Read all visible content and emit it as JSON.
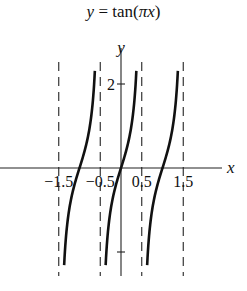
{
  "chart_data": {
    "type": "line",
    "title": "y = tan(πx)",
    "title_parts": {
      "lhs": "y",
      "eq": " = tan(",
      "pi": "π",
      "var": "x",
      "close": ")"
    },
    "xlabel": "x",
    "ylabel": "y",
    "function": "tan(pi*x)",
    "xlim": [
      -2.3,
      2.8
    ],
    "ylim": [
      -2.7,
      2.5
    ],
    "x_ticks": [
      -1.5,
      -0.5,
      0.5,
      1.5
    ],
    "x_tick_labels": [
      "-1.5",
      "-0.5",
      "0.5",
      "1.5"
    ],
    "y_ticks": [
      2,
      -2
    ],
    "y_tick_labels": [
      "2",
      ""
    ],
    "asymptotes": [
      -1.5,
      -0.5,
      0.5,
      1.5
    ],
    "branches": [
      {
        "center": -1,
        "x_range": [
          -1.37,
          -0.63
        ]
      },
      {
        "center": 0,
        "x_range": [
          -0.37,
          0.37
        ]
      },
      {
        "center": 1,
        "x_range": [
          0.63,
          1.37
        ]
      }
    ],
    "grid": false,
    "legend": null
  },
  "layout": {
    "origin_px": [
      121,
      168
    ],
    "x_scale_px": 41.5,
    "y_scale_px": 42,
    "curve_color": "#111111",
    "asymptote_color": "#222222"
  }
}
